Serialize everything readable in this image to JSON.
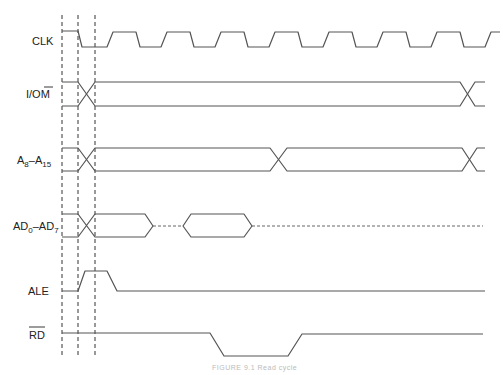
{
  "diagram": {
    "caption": "FIGURE 9.1 Read cycle",
    "colors": {
      "line": "#555555",
      "marker": "#333333",
      "label": "#222222"
    },
    "markers_x": [
      62,
      78,
      95
    ],
    "signals": [
      {
        "id": "clk",
        "label": "CLK",
        "type": "clock",
        "label_y": 41
      },
      {
        "id": "io_m",
        "label_main": "I/O",
        "label_bar": "M",
        "type": "bus",
        "label_y": 98
      },
      {
        "id": "a8_a15",
        "label_main": "A",
        "sub1": "8",
        "dash": "–A",
        "sub2": "15",
        "type": "bus",
        "label_y": 163
      },
      {
        "id": "ad0_ad7",
        "label_main": "AD",
        "sub1": "0",
        "dash": "–AD",
        "sub2": "7",
        "type": "bus",
        "label_y": 229
      },
      {
        "id": "ale",
        "label": "ALE",
        "type": "pulse",
        "label_y": 285
      },
      {
        "id": "rd",
        "label_bar": "RD",
        "type": "active-low",
        "label_y": 337
      }
    ]
  }
}
